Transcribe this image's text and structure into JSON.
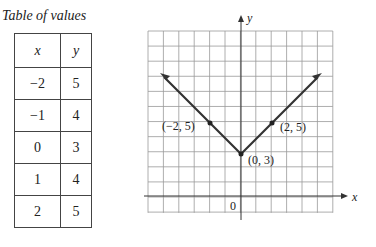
{
  "title": "Table of values",
  "table": {
    "headers": [
      "x",
      "y"
    ],
    "rows": [
      [
        "−2",
        "5"
      ],
      [
        "−1",
        "4"
      ],
      [
        "0",
        "3"
      ],
      [
        "1",
        "4"
      ],
      [
        "2",
        "5"
      ]
    ]
  },
  "graph": {
    "x_label": "x",
    "y_label": "y",
    "origin_label": "0",
    "point_labels": [
      "(−2, 5)",
      "(2, 5)",
      "(0, 3)"
    ]
  },
  "chart_data": {
    "type": "line",
    "title": "",
    "xlabel": "x",
    "ylabel": "y",
    "series": [
      {
        "name": "y = |x| + 3",
        "x": [
          -4,
          -3,
          -2,
          -1,
          0,
          1,
          2,
          3,
          4
        ],
        "y": [
          7,
          6,
          5,
          4,
          3,
          4,
          5,
          6,
          7
        ]
      }
    ],
    "labeled_points": [
      {
        "label": "(−2, 5)",
        "x": -2,
        "y": 5
      },
      {
        "label": "(2, 5)",
        "x": 2,
        "y": 5
      },
      {
        "label": "(0, 3)",
        "x": 0,
        "y": 3
      }
    ],
    "xlim": [
      -6,
      6
    ],
    "ylim": [
      -1,
      11
    ],
    "grid": true
  }
}
